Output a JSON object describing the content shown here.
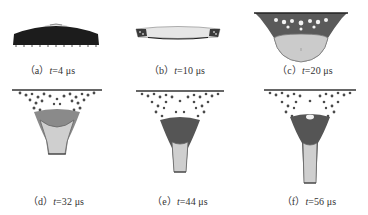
{
  "figure": {
    "panels": [
      {
        "id": "a",
        "label": "（a）",
        "var": "t",
        "value": "=4 μs",
        "time_us": 4,
        "shape": "dome"
      },
      {
        "id": "b",
        "label": "（b）",
        "var": "t",
        "value": "=10 μs",
        "time_us": 10,
        "shape": "thin-disk"
      },
      {
        "id": "c",
        "label": "（c）",
        "var": "t",
        "value": "=20 μs",
        "time_us": 20,
        "shape": "bowl"
      },
      {
        "id": "d",
        "label": "（d）",
        "var": "t",
        "value": "=32 μs",
        "time_us": 32,
        "shape": "cone"
      },
      {
        "id": "e",
        "label": "（e）",
        "var": "t",
        "value": "=44 μs",
        "time_us": 44,
        "shape": "funnel"
      },
      {
        "id": "f",
        "label": "（f）",
        "var": "t",
        "value": "=56 μs",
        "time_us": 56,
        "shape": "long-funnel"
      }
    ]
  },
  "colors": {
    "dark": "#1a1a1a",
    "mid": "#6b6b6b",
    "particle": "#4a4a4a",
    "fill_light": "#c8c8c8",
    "fill_lighter": "#dcdcdc",
    "outline": "#555555",
    "caption": "#333333"
  }
}
